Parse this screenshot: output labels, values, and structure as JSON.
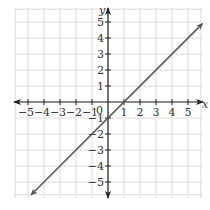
{
  "chart_data": {
    "type": "line",
    "title": "",
    "xlabel": "x",
    "ylabel": "y",
    "xlim": [
      -5.9,
      5.9
    ],
    "ylim": [
      -5.9,
      5.9
    ],
    "x_ticks": [
      -5,
      -4,
      -3,
      -2,
      -1,
      1,
      2,
      3,
      4,
      5
    ],
    "y_ticks": [
      -5,
      -4,
      -3,
      -2,
      -1,
      1,
      2,
      3,
      4,
      5
    ],
    "origin_label": "0",
    "grid": true,
    "series": [
      {
        "name": "y = x - 1",
        "equation": "y = x - 1",
        "slope": 1,
        "intercept": -1,
        "x": [
          -4.8,
          5.9
        ],
        "y": [
          -5.8,
          4.9
        ],
        "color": "#555555",
        "arrows": "both"
      }
    ]
  },
  "colors": {
    "grid": "#dddddd",
    "axis": "#222222",
    "line": "#555555"
  }
}
